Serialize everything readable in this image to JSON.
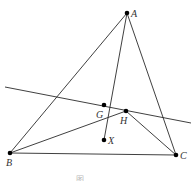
{
  "diagram": {
    "points": {
      "A": {
        "label": "A",
        "x": 127,
        "y": 13
      },
      "B": {
        "label": "B",
        "x": 10,
        "y": 153
      },
      "C": {
        "label": "C",
        "x": 176,
        "y": 155
      },
      "G": {
        "label": "G",
        "x": 104,
        "y": 105
      },
      "H": {
        "label": "H",
        "x": 126,
        "y": 111
      },
      "X": {
        "label": "X",
        "x": 104,
        "y": 140
      }
    },
    "segments": [
      [
        "A",
        "B"
      ],
      [
        "A",
        "C"
      ],
      [
        "A",
        "X"
      ],
      [
        "B",
        "C"
      ],
      [
        "B",
        "H"
      ],
      [
        "H",
        "C"
      ]
    ],
    "line": {
      "x1": 5,
      "y1": 87,
      "x2": 191,
      "y2": 123
    },
    "caption": "图"
  }
}
